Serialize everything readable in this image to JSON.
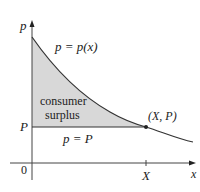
{
  "diagram": {
    "title": "Consumer surplus",
    "y_axis_label": "p",
    "x_axis_label": "x",
    "origin_label": "0",
    "curve_label": "p = p(x)",
    "region_label_line1": "consumer",
    "region_label_line2": "surplus",
    "price_level_label": "P",
    "price_line_label": "p = P",
    "point_label": "(X, P)",
    "x_tick_label": "X",
    "colors": {
      "fill": "#d8d8d8",
      "line": "#333333",
      "text": "#222222"
    }
  }
}
